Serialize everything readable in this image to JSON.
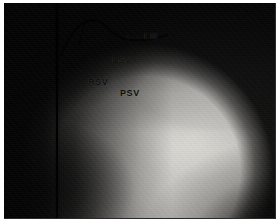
{
  "figure": {
    "type": "radiograph",
    "modality": "angiogram",
    "view_shape": "round-fluoroscopic-field",
    "background_color": "#ffffff",
    "plate_color": "#090909",
    "annotation_color": "#0d0d0d"
  },
  "annotations": [
    {
      "id": "lm",
      "label": "LM",
      "has_leader_arrow": true,
      "arrow_direction": "left",
      "x": 140,
      "y": 29
    },
    {
      "id": "lsv",
      "label": "LSV",
      "has_leader_arrow": false,
      "x": 108,
      "y": 53
    },
    {
      "id": "rsv",
      "label": "RSV",
      "has_leader_arrow": false,
      "x": 84,
      "y": 75
    },
    {
      "id": "psv",
      "label": "PSV",
      "has_leader_arrow": false,
      "x": 116,
      "y": 86
    }
  ],
  "overlays": {
    "catheter_label": "catheter-line"
  }
}
